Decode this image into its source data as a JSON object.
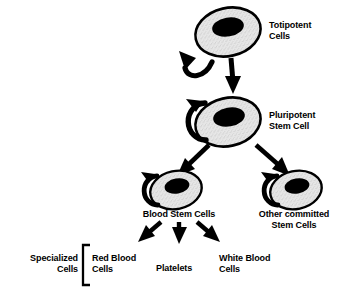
{
  "diagram": {
    "background_color": "#ffffff",
    "ink_color": "#000000",
    "cell_fill_color": "#e0e0e0",
    "nucleus_color": "#000000",
    "labels": {
      "totipotent": "Totipotent\nCells",
      "pluripotent": "Pluripotent\nStem Cell",
      "blood_stem": "Blood Stem Cells",
      "other_committed": "Other committed\nStem Cells",
      "red_blood": "Red Blood\nCells",
      "platelets": "Platelets",
      "white_blood": "White Blood\nCells",
      "specialized": "Specialized\nCells"
    },
    "nodes": [
      {
        "id": "totipotent",
        "label": "Totipotent Cells",
        "level": 1,
        "self_renewal": true
      },
      {
        "id": "pluripotent",
        "label": "Pluripotent Stem Cell",
        "level": 2,
        "self_renewal": true
      },
      {
        "id": "blood_stem",
        "label": "Blood Stem Cells",
        "level": 3,
        "self_renewal": true
      },
      {
        "id": "other_committed",
        "label": "Other committed Stem Cells",
        "level": 3,
        "self_renewal": true
      },
      {
        "id": "red_blood",
        "label": "Red Blood Cells",
        "level": 4,
        "self_renewal": false
      },
      {
        "id": "platelets",
        "label": "Platelets",
        "level": 4,
        "self_renewal": false
      },
      {
        "id": "white_blood",
        "label": "White Blood Cells",
        "level": 4,
        "self_renewal": false
      }
    ],
    "edges": [
      {
        "from": "totipotent",
        "to": "pluripotent"
      },
      {
        "from": "pluripotent",
        "to": "blood_stem"
      },
      {
        "from": "pluripotent",
        "to": "other_committed"
      },
      {
        "from": "blood_stem",
        "to": "red_blood"
      },
      {
        "from": "blood_stem",
        "to": "platelets"
      },
      {
        "from": "blood_stem",
        "to": "white_blood"
      }
    ],
    "grouping": {
      "bracket_label": "Specialized Cells",
      "members": [
        "red_blood",
        "platelets",
        "white_blood"
      ]
    }
  }
}
